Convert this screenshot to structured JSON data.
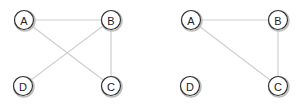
{
  "graphs": [
    {
      "name": "graph-left",
      "nodes": [
        {
          "id": "A",
          "label": "A",
          "x": 24,
          "y": 20
        },
        {
          "id": "B",
          "label": "B",
          "x": 111,
          "y": 20
        },
        {
          "id": "D",
          "label": "D",
          "x": 23,
          "y": 86
        },
        {
          "id": "C",
          "label": "C",
          "x": 111,
          "y": 86
        }
      ],
      "edges": [
        [
          "A",
          "B"
        ],
        [
          "A",
          "C"
        ],
        [
          "B",
          "D"
        ],
        [
          "B",
          "C"
        ]
      ]
    },
    {
      "name": "graph-right",
      "nodes": [
        {
          "id": "A",
          "label": "A",
          "x": 191,
          "y": 20
        },
        {
          "id": "B",
          "label": "B",
          "x": 278,
          "y": 20
        },
        {
          "id": "D",
          "label": "D",
          "x": 190,
          "y": 86
        },
        {
          "id": "C",
          "label": "C",
          "x": 278,
          "y": 86
        }
      ],
      "edges": [
        [
          "A",
          "B"
        ],
        [
          "A",
          "C"
        ],
        [
          "B",
          "C"
        ]
      ]
    }
  ],
  "style": {
    "edge_color": "#cfcfcf",
    "node_stroke": "#333333",
    "node_radius": 9.5
  }
}
